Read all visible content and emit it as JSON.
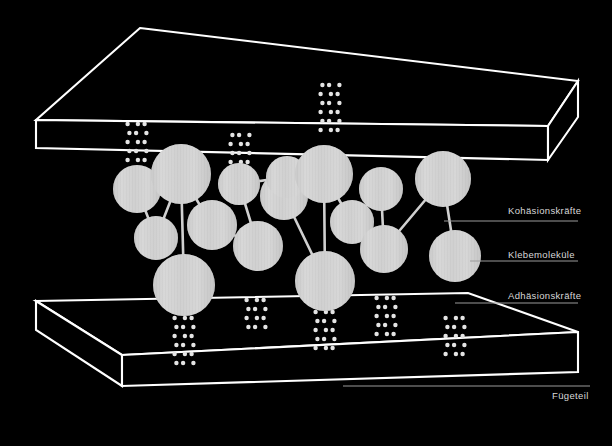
{
  "figure": {
    "background_color": "#000000",
    "line_color": "#ffffff",
    "molecule_color": "#d0d0d0",
    "label_color": "#d8d8d8",
    "leader_color": "#9a9a9a"
  },
  "labels": {
    "cohesion": "Kohäsionskräfte",
    "adhesive_molecules": "Klebemoleküle",
    "adhesion": "Adhäsionskräfte",
    "substrate": "Fügeteil"
  },
  "parts": {
    "upper_plate_name": "upper-substrate-plate",
    "lower_plate_name": "lower-substrate-plate"
  },
  "chart_data": {
    "type": "diagram",
    "upper_plate": {
      "top_face": [
        [
          140,
          28
        ],
        [
          578,
          81
        ],
        [
          548,
          126
        ],
        [
          36,
          120
        ]
      ],
      "front_face": [
        [
          36,
          120
        ],
        [
          548,
          126
        ],
        [
          548,
          160
        ],
        [
          36,
          148
        ]
      ],
      "right_face": [
        [
          548,
          126
        ],
        [
          578,
          81
        ],
        [
          578,
          117
        ],
        [
          548,
          160
        ]
      ]
    },
    "lower_plate": {
      "top_face": [
        [
          36,
          301
        ],
        [
          468,
          293
        ],
        [
          578,
          332
        ],
        [
          122,
          355
        ]
      ],
      "front_face": [
        [
          36,
          301
        ],
        [
          36,
          330
        ],
        [
          122,
          386
        ],
        [
          122,
          355
        ]
      ],
      "right_face": [
        [
          122,
          355
        ],
        [
          578,
          332
        ],
        [
          578,
          372
        ],
        [
          122,
          386
        ]
      ]
    },
    "molecules": [
      {
        "id": "m1",
        "cx": 137,
        "cy": 189,
        "r": 24
      },
      {
        "id": "m2",
        "cx": 156,
        "cy": 238,
        "r": 22
      },
      {
        "id": "m3",
        "cx": 181,
        "cy": 174,
        "r": 30
      },
      {
        "id": "m4",
        "cx": 184,
        "cy": 285,
        "r": 31
      },
      {
        "id": "m5",
        "cx": 212,
        "cy": 225,
        "r": 25
      },
      {
        "id": "m6",
        "cx": 239,
        "cy": 184,
        "r": 21
      },
      {
        "id": "m7",
        "cx": 258,
        "cy": 246,
        "r": 25
      },
      {
        "id": "m8",
        "cx": 284,
        "cy": 196,
        "r": 24
      },
      {
        "id": "m9",
        "cx": 287,
        "cy": 177,
        "r": 21
      },
      {
        "id": "m10",
        "cx": 324,
        "cy": 174,
        "r": 29
      },
      {
        "id": "m11",
        "cx": 325,
        "cy": 281,
        "r": 30
      },
      {
        "id": "m12",
        "cx": 352,
        "cy": 222,
        "r": 22
      },
      {
        "id": "m13",
        "cx": 381,
        "cy": 189,
        "r": 22
      },
      {
        "id": "m14",
        "cx": 384,
        "cy": 249,
        "r": 24
      },
      {
        "id": "m15",
        "cx": 443,
        "cy": 179,
        "r": 28
      },
      {
        "id": "m16",
        "cx": 455,
        "cy": 256,
        "r": 26
      }
    ],
    "bonds": [
      [
        "m1",
        "m2"
      ],
      [
        "m3",
        "m2"
      ],
      [
        "m3",
        "m5"
      ],
      [
        "m3",
        "m4"
      ],
      [
        "m5",
        "m7"
      ],
      [
        "m6",
        "m7"
      ],
      [
        "m6",
        "m9"
      ],
      [
        "m10",
        "m8"
      ],
      [
        "m10",
        "m11"
      ],
      [
        "m10",
        "m12"
      ],
      [
        "m12",
        "m14"
      ],
      [
        "m13",
        "m14"
      ],
      [
        "m13",
        "m12"
      ],
      [
        "m11",
        "m8"
      ],
      [
        "m15",
        "m16"
      ],
      [
        "m15",
        "m14"
      ]
    ],
    "adhesion_clusters": [
      {
        "x": 137,
        "y": 160,
        "anchor": "top",
        "rows": 5
      },
      {
        "x": 240,
        "y": 162,
        "anchor": "top",
        "rows": 4
      },
      {
        "x": 330,
        "y": 130,
        "anchor": "top",
        "rows": 6
      },
      {
        "x": 184,
        "y": 318,
        "anchor": "bottom",
        "rows": 6
      },
      {
        "x": 256,
        "y": 300,
        "anchor": "bottom",
        "rows": 4
      },
      {
        "x": 325,
        "y": 312,
        "anchor": "bottom",
        "rows": 5
      },
      {
        "x": 386,
        "y": 298,
        "anchor": "bottom",
        "rows": 5
      },
      {
        "x": 455,
        "y": 318,
        "anchor": "bottom",
        "rows": 5
      }
    ],
    "leader_lines": [
      {
        "name": "cohesion-leader",
        "x1": 444,
        "y1": 221,
        "x2": 578,
        "y2": 221
      },
      {
        "name": "molecule-leader",
        "x1": 470,
        "y1": 261,
        "x2": 578,
        "y2": 261
      },
      {
        "name": "adhesion-leader",
        "x1": 455,
        "y1": 303,
        "x2": 578,
        "y2": 303
      },
      {
        "name": "substrate-leader",
        "x1": 343,
        "y1": 386,
        "x2": 590,
        "y2": 386
      }
    ]
  }
}
